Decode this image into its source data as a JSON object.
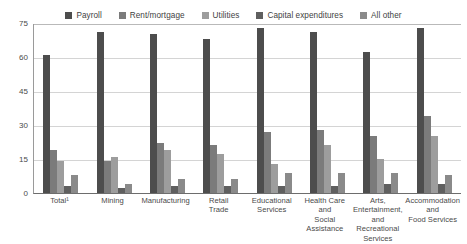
{
  "legend": {
    "position": "top-center",
    "entries": [
      {
        "label": "Payroll",
        "color": "#4d4d4d",
        "icon": "square-swatch"
      },
      {
        "label": "Rent/mortgage",
        "color": "#7b7b7b",
        "icon": "square-swatch"
      },
      {
        "label": "Utilities",
        "color": "#9d9d9d",
        "icon": "square-swatch"
      },
      {
        "label": "Capital expenditures",
        "color": "#5f5f5f",
        "icon": "square-swatch"
      },
      {
        "label": "All other",
        "color": "#8a8a8a",
        "icon": "square-swatch"
      }
    ]
  },
  "axes": {
    "yticks": [
      "0",
      "15",
      "30",
      "45",
      "60",
      "75"
    ],
    "ymin": 0,
    "ymax": 75,
    "grid": true
  },
  "chart_data": {
    "type": "bar",
    "title": "",
    "xlabel": "",
    "ylabel": "",
    "ylim": [
      0,
      75
    ],
    "yticks": [
      0,
      15,
      30,
      45,
      60,
      75
    ],
    "grid": true,
    "legend_position": "top-center",
    "categories": [
      "Total¹",
      "Mining",
      "Manufacturing",
      "Retail\nTrade",
      "Educational\nServices",
      "Health Care\nand\nSocial\nAssistance",
      "Arts,\nEntertainment,\nand\nRecreational\nServices",
      "Accommodation\nand\nFood Services"
    ],
    "series": [
      {
        "name": "Payroll",
        "color": "#4d4d4d",
        "values": [
          61,
          71,
          70,
          68,
          73,
          71,
          62,
          73
        ]
      },
      {
        "name": "Rent/mortgage",
        "color": "#7b7b7b",
        "values": [
          19,
          14,
          22,
          21,
          27,
          28,
          25,
          34
        ]
      },
      {
        "name": "Utilities",
        "color": "#9d9d9d",
        "values": [
          14,
          16,
          19,
          17,
          13,
          21,
          15,
          25
        ]
      },
      {
        "name": "Capital expenditures",
        "color": "#5f5f5f",
        "values": [
          3,
          2,
          3,
          3,
          3,
          3,
          4,
          4
        ]
      },
      {
        "name": "All other",
        "color": "#8a8a8a",
        "values": [
          8,
          4,
          6,
          6,
          9,
          9,
          9,
          8
        ]
      }
    ]
  }
}
